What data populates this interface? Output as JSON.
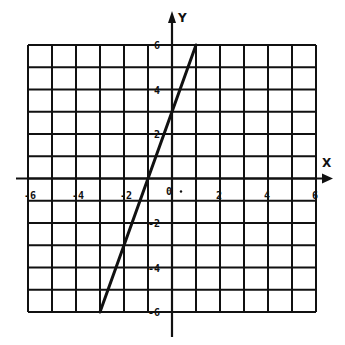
{
  "chart_data": {
    "type": "line",
    "title": "",
    "xlabel": "X",
    "ylabel": "Y",
    "xlim": [
      -6,
      6
    ],
    "ylim": [
      -6,
      6
    ],
    "grid": true,
    "grid_step": 1,
    "x_ticks": [
      -6,
      -4,
      -2,
      2,
      4,
      6
    ],
    "x_tick_labels": [
      "-6",
      "-4",
      "-2",
      "2",
      "4",
      "6"
    ],
    "y_ticks": [
      6,
      4,
      2,
      -2,
      -4,
      -6
    ],
    "y_tick_labels": [
      "6",
      "4",
      "2",
      "-2",
      "-4",
      "-6"
    ],
    "origin_label": "0",
    "series": [
      {
        "name": "y = 3x + 3",
        "x": [
          -3,
          1
        ],
        "y": [
          -6,
          6
        ],
        "slope": 3,
        "intercept": 3
      }
    ],
    "legend": null
  },
  "colors": {
    "ink": "#111111",
    "background": "#ffffff"
  }
}
